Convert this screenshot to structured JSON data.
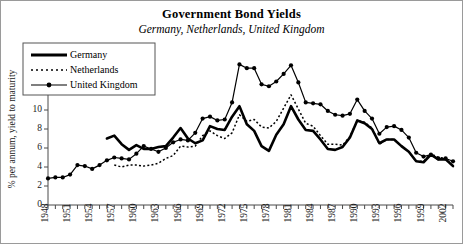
{
  "chart_data": {
    "type": "line",
    "title": "Government Bond Yields",
    "subtitle": "Germany, Netherlands, United Kingdom",
    "xlabel": "",
    "ylabel": "% per annum, yield to maturity",
    "ylim": [
      0,
      16
    ],
    "yticks": [
      0,
      2,
      4,
      6,
      8,
      10,
      12,
      14,
      16
    ],
    "xlim": [
      1948,
      2003
    ],
    "xticks": [
      1948,
      1951,
      1954,
      1957,
      1960,
      1963,
      1966,
      1969,
      1972,
      1975,
      1978,
      1981,
      1984,
      1987,
      1990,
      1993,
      1996,
      1999,
      2002
    ],
    "xtick_step": 1,
    "grid": false,
    "legend_position": "top-left",
    "series": [
      {
        "name": "Germany",
        "style": "solid-thick",
        "x": [
          1956,
          1957,
          1958,
          1959,
          1960,
          1961,
          1962,
          1963,
          1964,
          1965,
          1966,
          1967,
          1968,
          1969,
          1970,
          1971,
          1972,
          1973,
          1974,
          1975,
          1976,
          1977,
          1978,
          1979,
          1980,
          1981,
          1982,
          1983,
          1984,
          1985,
          1986,
          1987,
          1988,
          1989,
          1990,
          1991,
          1992,
          1993,
          1994,
          1995,
          1996,
          1997,
          1998,
          1999,
          2000,
          2001,
          2002,
          2003
        ],
        "values": [
          7.0,
          7.3,
          6.4,
          5.8,
          6.3,
          5.9,
          5.9,
          6.1,
          6.2,
          7.1,
          8.1,
          7.0,
          6.5,
          6.8,
          8.3,
          8.0,
          7.9,
          9.3,
          10.4,
          8.5,
          7.8,
          6.2,
          5.7,
          7.4,
          8.5,
          10.4,
          9.0,
          7.9,
          7.8,
          6.9,
          5.9,
          5.8,
          6.1,
          7.1,
          8.9,
          8.6,
          8.0,
          6.5,
          6.9,
          6.9,
          6.2,
          5.6,
          4.6,
          4.5,
          5.3,
          4.8,
          4.8,
          4.1
        ]
      },
      {
        "name": "Netherlands",
        "style": "dotted",
        "x": [
          1957,
          1958,
          1959,
          1960,
          1961,
          1962,
          1963,
          1964,
          1965,
          1966,
          1967,
          1968,
          1969,
          1970,
          1971,
          1972,
          1973,
          1974,
          1975,
          1976,
          1977,
          1978,
          1979,
          1980,
          1981,
          1982,
          1983,
          1984,
          1985,
          1986,
          1987,
          1988,
          1989,
          1990,
          1991,
          1992,
          1993,
          1994,
          1995,
          1996,
          1997,
          1998,
          1999,
          2000,
          2001,
          2002,
          2003
        ],
        "values": [
          4.2,
          4.0,
          4.2,
          4.2,
          4.1,
          4.2,
          4.4,
          4.9,
          5.2,
          6.2,
          6.1,
          6.2,
          7.3,
          7.8,
          7.3,
          7.0,
          7.6,
          9.5,
          8.8,
          9.0,
          8.2,
          8.1,
          8.8,
          10.2,
          11.6,
          10.1,
          8.6,
          8.3,
          7.3,
          6.4,
          6.4,
          6.3,
          7.2,
          8.9,
          8.7,
          8.1,
          6.4,
          6.9,
          6.9,
          6.2,
          5.6,
          4.6,
          4.6,
          5.4,
          5.0,
          4.9,
          4.1
        ]
      },
      {
        "name": "United Kingdom",
        "style": "solid-markers",
        "x": [
          1948,
          1949,
          1950,
          1951,
          1952,
          1953,
          1954,
          1955,
          1956,
          1957,
          1958,
          1959,
          1960,
          1961,
          1962,
          1963,
          1964,
          1965,
          1966,
          1967,
          1968,
          1969,
          1970,
          1971,
          1972,
          1973,
          1974,
          1975,
          1976,
          1977,
          1978,
          1979,
          1980,
          1981,
          1982,
          1983,
          1984,
          1985,
          1986,
          1987,
          1988,
          1989,
          1990,
          1991,
          1992,
          1993,
          1994,
          1995,
          1996,
          1997,
          1998,
          1999,
          2000,
          2001,
          2002,
          2003
        ],
        "values": [
          2.8,
          2.9,
          2.9,
          3.2,
          4.2,
          4.1,
          3.8,
          4.2,
          4.7,
          5.0,
          4.9,
          4.8,
          5.4,
          6.2,
          5.9,
          5.6,
          6.0,
          6.6,
          6.9,
          6.8,
          7.6,
          9.1,
          9.3,
          8.9,
          9.0,
          10.8,
          14.8,
          14.4,
          14.4,
          12.7,
          12.5,
          13.0,
          13.8,
          14.7,
          12.9,
          10.8,
          10.7,
          10.6,
          9.9,
          9.5,
          9.4,
          9.6,
          11.1,
          9.9,
          9.1,
          7.5,
          8.2,
          8.3,
          7.9,
          7.1,
          5.5,
          5.1,
          5.3,
          4.9,
          4.9,
          4.6
        ]
      }
    ]
  }
}
